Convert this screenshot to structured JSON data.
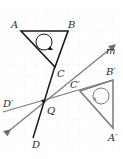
{
  "diagram": {
    "type": "geometry-reflection",
    "grid": {
      "spacing_px": 11,
      "color": "#d9d9d9"
    },
    "labels": {
      "A": "A",
      "B": "B",
      "C": "C",
      "D": "D",
      "Q": "Q",
      "m": "m",
      "A_prime": "A′",
      "B_prime": "B′",
      "C_prime": "C′",
      "D_prime": "D′"
    },
    "colors": {
      "original": "#1a1a1a",
      "image": "#7a7a7a",
      "mirror_line": "#7a7a7a"
    },
    "shapes": {
      "triangle_ABC": "original triangle with counter-clockwise circular arrow",
      "triangle_A1B1C1": "reflected triangle with clockwise circular arrow",
      "segment_CD": "original line through Q",
      "segment_C1D1": "reflected line through Q",
      "line_m": "mirror line with arrow"
    }
  }
}
